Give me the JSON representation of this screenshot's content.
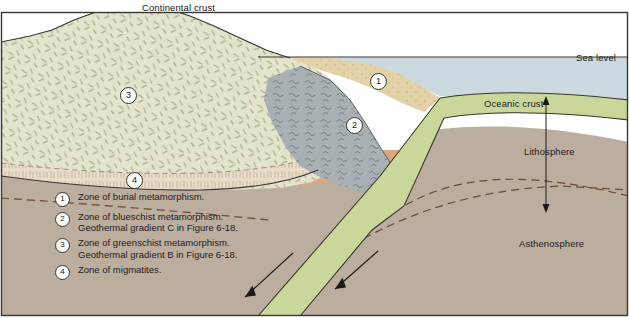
{
  "figure": {
    "type": "geologic-cross-section"
  },
  "labels": {
    "sea_level": "Sea level",
    "continental_crust": "Continental crust",
    "oceanic_crust": "Oceanic crust",
    "lithosphere": "Lithosphere",
    "asthenosphere": "Asthenosphere"
  },
  "markers": [
    {
      "id": "1",
      "number": "1"
    },
    {
      "id": "2",
      "number": "2"
    },
    {
      "id": "3",
      "number": "3"
    },
    {
      "id": "4",
      "number": "4"
    }
  ],
  "legend": [
    {
      "number": "1",
      "line1": "Zone of burial metamorphism.",
      "line2": ""
    },
    {
      "number": "2",
      "line1": "Zone of blueschist metamorphism.",
      "line2": "Geothermal gradient C in Figure 6-18."
    },
    {
      "number": "3",
      "line1": "Zone of greenschist metamorphism.",
      "line2": "Geothermal gradient B in Figure 6-18."
    },
    {
      "number": "4",
      "line1": "Zone of migmatites.",
      "line2": ""
    }
  ],
  "colors": {
    "water": "#ccdae0",
    "sky": "#ffffff",
    "continental_crust": "#e3e4cc",
    "migmatite_zone": "#e7ddc9",
    "blueschist_zone": "#a8b0b4",
    "burial_sediment": "#e3d2a8",
    "oceanic_crust": "#c9d89a",
    "lithosphere_mantle": "#bcae9f",
    "asthenosphere": "#d9a784",
    "outline": "#3a3630",
    "text": "#23201d"
  }
}
